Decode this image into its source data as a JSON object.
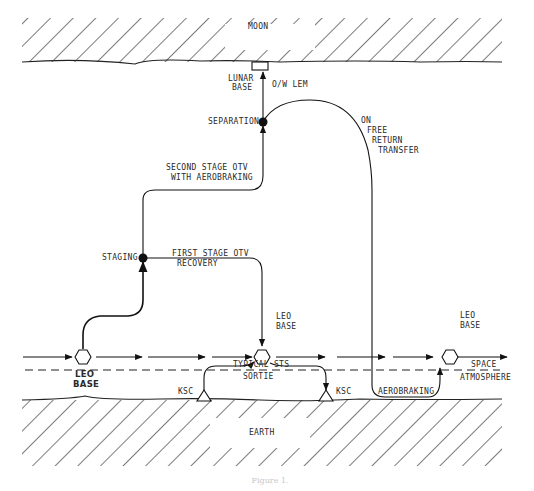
{
  "diagram": {
    "regions": {
      "moon": "MOON",
      "earth": "EARTH",
      "space": "SPACE",
      "atmosphere": "ATMOSPHERE"
    },
    "nodes": {
      "lunar_base": [
        "LUNAR",
        "BASE"
      ],
      "separation": "SEPARATION",
      "staging": "STAGING",
      "leo_base_left": [
        "LEO",
        "BASE"
      ],
      "leo_base_center": [
        "LEO",
        "BASE"
      ],
      "leo_base_right": [
        "LEO",
        "BASE"
      ],
      "ksc_left": "KSC",
      "ksc_right": "KSC"
    },
    "paths": {
      "ow_lem": "O/W LEM",
      "free_return": [
        "ON",
        "FREE",
        "RETURN",
        "TRANSFER"
      ],
      "second_stage": [
        "SECOND STAGE OTV",
        "WITH AEROBRAKING"
      ],
      "first_stage": [
        "FIRST STAGE OTV",
        "RECOVERY"
      ],
      "sts_sortie": [
        "TYPICAL STS",
        "SORTIE"
      ],
      "aerobraking": "AEROBRAKING"
    },
    "caption": "Figure 1."
  }
}
